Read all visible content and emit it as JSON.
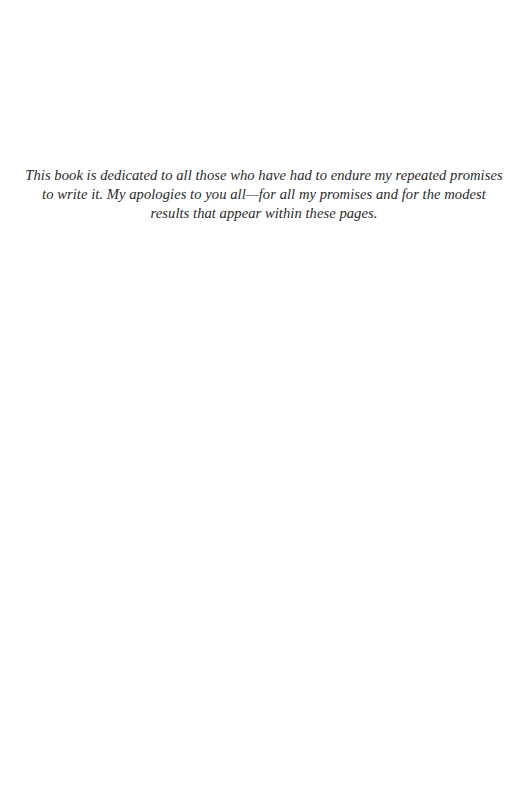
{
  "page": {
    "type": "dedication",
    "dedication": {
      "text": "This book is dedicated to all those who have had to endure my repeated promises to write it. My apologies to you all—for all my promises and for the modest results that appear within these pages."
    }
  }
}
